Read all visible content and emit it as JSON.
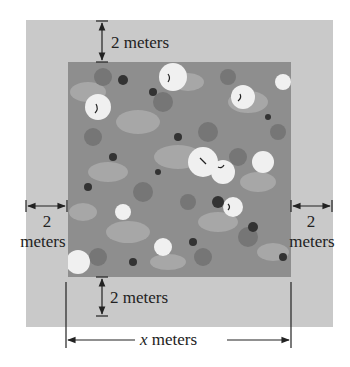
{
  "diagram": {
    "type": "garden-with-border",
    "colors": {
      "background": "#ffffff",
      "border_region": "#c9c9c9",
      "garden_region": "#8e8e8e",
      "line": "#222222"
    },
    "labels": {
      "top_width": "2 meters",
      "bottom_width": "2 meters",
      "left_number": "2",
      "left_unit": "meters",
      "right_number": "2",
      "right_unit": "meters",
      "total_variable": "x",
      "total_unit": "meters"
    }
  }
}
